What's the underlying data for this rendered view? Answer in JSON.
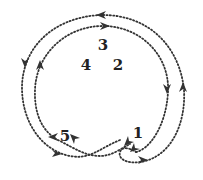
{
  "diagram": {
    "stroke_color": "#333333",
    "labels": [
      {
        "id": "label-3",
        "text": "3",
        "x": 103,
        "y": 45
      },
      {
        "id": "label-4",
        "text": "4",
        "x": 86,
        "y": 65
      },
      {
        "id": "label-2",
        "text": "2",
        "x": 118,
        "y": 65
      },
      {
        "id": "label-5",
        "text": "5",
        "x": 65,
        "y": 136
      },
      {
        "id": "label-1",
        "text": "1",
        "x": 138,
        "y": 133
      }
    ],
    "loops": [
      {
        "name": "outer-loop",
        "direction": "counterclockwise"
      },
      {
        "name": "inner-loop",
        "direction": "clockwise"
      }
    ]
  }
}
